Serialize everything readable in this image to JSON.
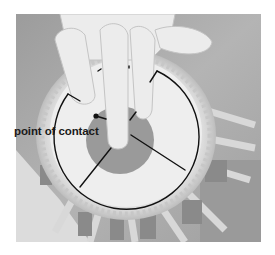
{
  "figure": {
    "style": "grayscale photograph with line-drawing annotation overlay",
    "photo_bounds": {
      "x": 16,
      "y": 14,
      "width": 245,
      "height": 228
    },
    "annotations": {
      "label": "point of contact",
      "label_position": {
        "x": 14,
        "y": 126
      },
      "contact_point": {
        "x": 96,
        "y": 116
      }
    },
    "overlay": {
      "arc_center": {
        "x": 126.5,
        "y": 131
      },
      "arc_radius": 72.5,
      "line_color": "#111111",
      "fill_color": "#ffffff"
    },
    "colors": {
      "background": "#ffffff",
      "photo_mid_gray": "#a8a8a8",
      "photo_dark_gray": "#8e8e8e",
      "photo_light": "#e6e6e6",
      "syahi_gray": "#9a9a9a",
      "skin": "#ececec"
    }
  }
}
